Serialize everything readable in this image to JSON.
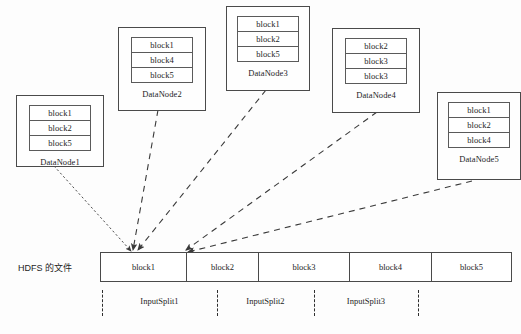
{
  "diagram": {
    "hdfs_label": "HDFS 的文件",
    "colors": {
      "background": "#fdfdfd",
      "stroke": "#4a4a4a",
      "edge": "#3a3a3a",
      "text": "#1d1d1d"
    },
    "datanodes": [
      {
        "name": "DataNode1",
        "blocks": [
          "block1",
          "block2",
          "block5"
        ]
      },
      {
        "name": "DataNode2",
        "blocks": [
          "block1",
          "block4",
          "block5"
        ]
      },
      {
        "name": "DataNode3",
        "blocks": [
          "block1",
          "block2",
          "block5"
        ]
      },
      {
        "name": "DataNode4",
        "blocks": [
          "block2",
          "block3",
          "block3"
        ]
      },
      {
        "name": "DataNode5",
        "blocks": [
          "block1",
          "block2",
          "block4"
        ]
      }
    ],
    "file_blocks": [
      {
        "label": "block1"
      },
      {
        "label": "block2"
      },
      {
        "label": "block3"
      },
      {
        "label": "block4"
      },
      {
        "label": "block5"
      }
    ],
    "input_splits": [
      {
        "label": "InputSplit1"
      },
      {
        "label": "InputSplit2"
      },
      {
        "label": "InputSplit3"
      }
    ]
  }
}
